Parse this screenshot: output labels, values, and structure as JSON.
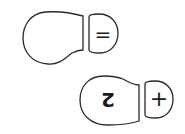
{
  "diagram": {
    "footprints": [
      {
        "id": "top",
        "sole_label": "",
        "heel_label": "="
      },
      {
        "id": "bottom",
        "sole_label": "2",
        "sole_label_rotation_deg": 180,
        "heel_label": "+"
      }
    ],
    "colors": {
      "stroke": "#2a2a2a",
      "fill": "#ffffff",
      "background": "#ffffff"
    }
  }
}
